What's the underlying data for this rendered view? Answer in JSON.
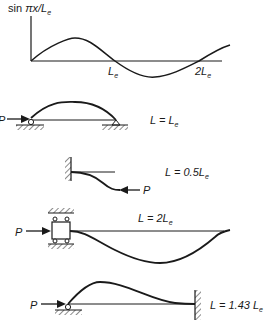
{
  "figure": {
    "top_plot": {
      "ylabel_prefix": "sin ",
      "ylabel_math": "πx/L",
      "ylabel_sub": "e",
      "tick1_main": "L",
      "tick1_sub": "e",
      "tick2_main": "2L",
      "tick2_sub": "e"
    },
    "cases": [
      {
        "name": "pinned-pinned",
        "load": "P",
        "eq_main": "L = L",
        "eq_sub": "e"
      },
      {
        "name": "fixed-free",
        "load": "P",
        "eq_main": "L = 0.5L",
        "eq_sub": "e"
      },
      {
        "name": "guided-free",
        "load": "P",
        "length_main": "L = 2L",
        "length_sub": "e"
      },
      {
        "name": "pinned-fixed",
        "load": "P",
        "eq_main": "L = 1.43 L",
        "eq_sub": "e"
      }
    ]
  },
  "colors": {
    "ink": "#1a1a1a",
    "background": "#ffffff"
  }
}
